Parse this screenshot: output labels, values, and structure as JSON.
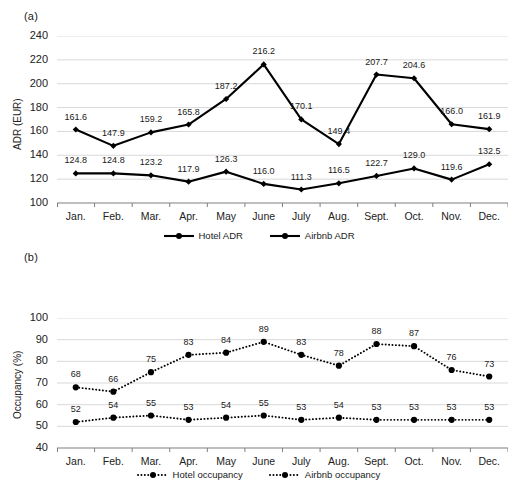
{
  "figure": {
    "background": "#ffffff",
    "ink": "#000000",
    "gridline_color": "#d9d9d9",
    "axis_color": "#7f7f7f"
  },
  "panels": [
    {
      "id": "a",
      "label": "(a)",
      "ylabel": "ADR (EUR)",
      "yticks": [
        "240",
        "220",
        "200",
        "180",
        "160",
        "140",
        "120",
        "100"
      ],
      "xticks": [
        "Jan.",
        "Feb.",
        "Mar.",
        "Apr.",
        "May",
        "June",
        "July",
        "Aug.",
        "Sept.",
        "Oct.",
        "Nov.",
        "Dec."
      ],
      "legend": [
        {
          "label": "Hotel ADR",
          "style": "solid"
        },
        {
          "label": "Airbnb ADR",
          "style": "solid"
        }
      ]
    },
    {
      "id": "b",
      "label": "(b)",
      "ylabel": "Occupancy (%)",
      "yticks": [
        "100",
        "90",
        "80",
        "70",
        "60",
        "50",
        "40"
      ],
      "xticks": [
        "Jan.",
        "Feb.",
        "Mar.",
        "Apr.",
        "May",
        "June",
        "July",
        "Aug.",
        "Sept.",
        "Oct.",
        "Nov.",
        "Dec."
      ],
      "legend": [
        {
          "label": "Hotel occupancy",
          "style": "dotted"
        },
        {
          "label": "Airbnb occupancy",
          "style": "dotted"
        }
      ]
    }
  ],
  "chart_data": [
    {
      "type": "line",
      "panel": "a",
      "title": "(a)",
      "xlabel": "",
      "ylabel": "ADR (EUR)",
      "categories": [
        "Jan.",
        "Feb.",
        "Mar.",
        "Apr.",
        "May",
        "June",
        "July",
        "Aug.",
        "Sept.",
        "Oct.",
        "Nov.",
        "Dec."
      ],
      "ylim": [
        100,
        240
      ],
      "ytick_step": 20,
      "grid": true,
      "legend_position": "bottom",
      "series": [
        {
          "name": "Airbnb ADR",
          "style": "solid",
          "marker": "diamond",
          "values": [
            161.6,
            147.9,
            159.2,
            165.8,
            187.2,
            216.2,
            170.1,
            149.4,
            207.7,
            204.6,
            166.0,
            161.9
          ],
          "labels": [
            "161.6",
            "147.9",
            "159.2",
            "165.8",
            "187.2",
            "216.2",
            "170.1",
            "149.4",
            "207.7",
            "204.6",
            "166.0",
            "161.9"
          ]
        },
        {
          "name": "Hotel ADR",
          "style": "solid",
          "marker": "diamond",
          "values": [
            124.8,
            124.8,
            123.2,
            117.9,
            126.3,
            116.0,
            111.3,
            116.5,
            122.7,
            129.0,
            119.6,
            132.5
          ],
          "labels": [
            "124.8",
            "124.8",
            "123.2",
            "117.9",
            "126.3",
            "116.0",
            "111.3",
            "116.5",
            "122.7",
            "129.0",
            "119.6",
            "132.5"
          ]
        }
      ]
    },
    {
      "type": "line",
      "panel": "b",
      "title": "(b)",
      "xlabel": "",
      "ylabel": "Occupancy (%)",
      "categories": [
        "Jan.",
        "Feb.",
        "Mar.",
        "Apr.",
        "May",
        "June",
        "July",
        "Aug.",
        "Sept.",
        "Oct.",
        "Nov.",
        "Dec."
      ],
      "ylim": [
        40,
        100
      ],
      "ytick_step": 10,
      "grid": true,
      "legend_position": "bottom",
      "series": [
        {
          "name": "Airbnb occupancy",
          "style": "dotted",
          "marker": "circle",
          "values": [
            68,
            66,
            75,
            83,
            84,
            89,
            83,
            78,
            88,
            87,
            76,
            73
          ],
          "labels": [
            "68",
            "66",
            "75",
            "83",
            "84",
            "89",
            "83",
            "78",
            "88",
            "87",
            "76",
            "73"
          ]
        },
        {
          "name": "Hotel occupancy",
          "style": "dotted",
          "marker": "circle",
          "values": [
            52,
            54,
            55,
            53,
            54,
            55,
            53,
            54,
            53,
            53,
            53,
            53
          ],
          "labels": [
            "52",
            "54",
            "55",
            "53",
            "54",
            "55",
            "53",
            "54",
            "53",
            "53",
            "53",
            "53"
          ]
        }
      ]
    }
  ]
}
